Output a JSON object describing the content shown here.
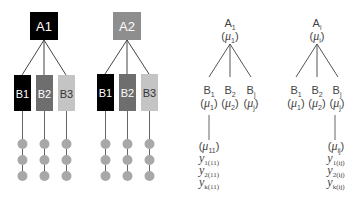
{
  "left_panel": {
    "trees": [
      {
        "root": {
          "label": "A1",
          "color": "#000000",
          "text_color": "#ffffff"
        },
        "children": [
          {
            "label": "B1",
            "color": "#000000",
            "text_color": "#ffffff"
          },
          {
            "label": "B2",
            "color": "#6e6e6e",
            "text_color": "#ffffff"
          },
          {
            "label": "B3",
            "color": "#c4c4c4",
            "text_color": "#333333"
          }
        ],
        "observations_per_child": 3
      },
      {
        "root": {
          "label": "A2",
          "color": "#8e8e8e",
          "text_color": "#ffffff"
        },
        "children": [
          {
            "label": "B1",
            "color": "#000000",
            "text_color": "#ffffff"
          },
          {
            "label": "B2",
            "color": "#6e6e6e",
            "text_color": "#ffffff"
          },
          {
            "label": "B3",
            "color": "#c4c4c4",
            "text_color": "#333333"
          }
        ],
        "observations_per_child": 3
      }
    ],
    "observation_color": "#a8a8a8"
  },
  "right_panel": {
    "trees": [
      {
        "root": {
          "name": "A",
          "sub": "1",
          "param": "μ",
          "param_sub": "1"
        },
        "children": [
          {
            "name": "B",
            "sub": "1",
            "param": "μ",
            "param_sub": "1"
          },
          {
            "name": "B",
            "sub": "2",
            "param": "μ",
            "param_sub": "2"
          },
          {
            "name": "B",
            "sub": "j",
            "param": "μ",
            "param_sub": "j"
          }
        ],
        "expanded_child_index": 0,
        "cell": {
          "param": "μ",
          "param_sub": "11"
        },
        "obs": [
          {
            "y": "y",
            "sub": "1(11)"
          },
          {
            "y": "y",
            "sub": "2(11)"
          },
          {
            "y": "y",
            "sub": "k(11)"
          }
        ]
      },
      {
        "root": {
          "name": "A",
          "sub": "i",
          "param": "μ",
          "param_sub": "i"
        },
        "children": [
          {
            "name": "B",
            "sub": "1",
            "param": "μ",
            "param_sub": "1"
          },
          {
            "name": "B",
            "sub": "2",
            "param": "μ",
            "param_sub": "2"
          },
          {
            "name": "B",
            "sub": "j",
            "param": "μ",
            "param_sub": "j"
          }
        ],
        "expanded_child_index": 2,
        "cell": {
          "param": "μ",
          "param_sub": "ij"
        },
        "obs": [
          {
            "y": "y",
            "sub": "1(ij)"
          },
          {
            "y": "y",
            "sub": "2(ij)"
          },
          {
            "y": "y",
            "sub": "k(ij)"
          }
        ]
      }
    ],
    "line_color": "#555555"
  }
}
